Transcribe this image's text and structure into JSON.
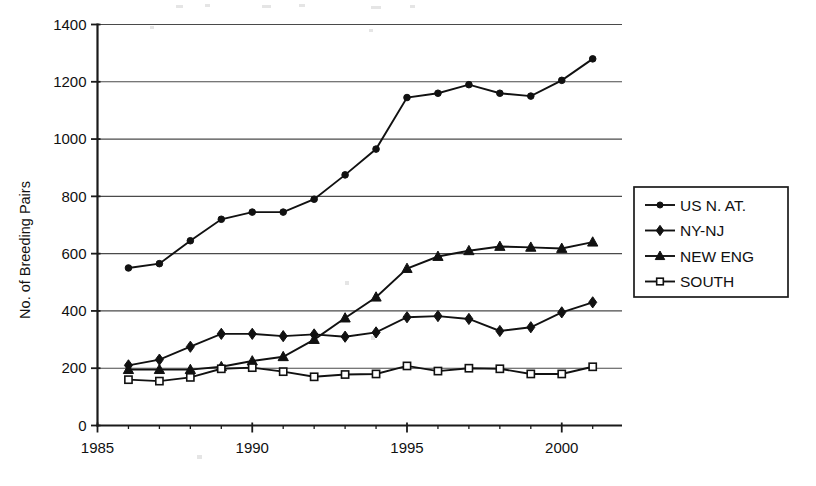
{
  "chart_data": {
    "type": "line",
    "title": "",
    "subtitle": "",
    "xlabel": "",
    "ylabel": "No. of Breeding Pairs",
    "xlim": [
      1985,
      2001.5
    ],
    "ylim": [
      0,
      1400
    ],
    "grid": "horizontal",
    "legend_position": "right-outside",
    "x_ticks": [
      1985,
      1990,
      1995,
      2000
    ],
    "x_tick_labels": [
      "1985",
      "1990",
      "1995",
      "2000"
    ],
    "x_minor_ticks": [
      1986,
      1987,
      1988,
      1989,
      1991,
      1992,
      1993,
      1994,
      1996,
      1997,
      1998,
      1999,
      2001
    ],
    "y_ticks": [
      0,
      200,
      400,
      600,
      800,
      1000,
      1200,
      1400
    ],
    "y_tick_labels": [
      "0",
      "200",
      "400",
      "600",
      "800",
      "1000",
      "1200",
      "1400"
    ],
    "x": [
      1986,
      1987,
      1988,
      1989,
      1990,
      1991,
      1992,
      1993,
      1994,
      1995,
      1996,
      1997,
      1998,
      1999,
      2000,
      2001
    ],
    "series": [
      {
        "name": "US N. AT.",
        "marker": "circle-filled",
        "values": [
          550,
          565,
          645,
          720,
          745,
          745,
          790,
          875,
          965,
          1145,
          1160,
          1190,
          1160,
          1150,
          1205,
          1280
        ]
      },
      {
        "name": "NY-NJ",
        "marker": "diamond-filled",
        "values": [
          210,
          230,
          275,
          320,
          320,
          312,
          318,
          310,
          325,
          378,
          382,
          372,
          330,
          343,
          395,
          430
        ]
      },
      {
        "name": "NEW ENG",
        "marker": "triangle-filled",
        "values": [
          195,
          195,
          195,
          205,
          225,
          240,
          300,
          375,
          448,
          548,
          590,
          610,
          625,
          622,
          618,
          640
        ]
      },
      {
        "name": "SOUTH",
        "marker": "square-open",
        "values": [
          160,
          155,
          168,
          198,
          202,
          188,
          170,
          178,
          180,
          208,
          190,
          200,
          198,
          180,
          180,
          205
        ]
      }
    ]
  },
  "legend": {
    "entries": [
      {
        "label": "US N. AT."
      },
      {
        "label": "NY-NJ"
      },
      {
        "label": "NEW ENG"
      },
      {
        "label": "SOUTH"
      }
    ]
  },
  "colors": {
    "ink": "#111111",
    "grid": "#4a4a4a",
    "background": "#ffffff"
  }
}
